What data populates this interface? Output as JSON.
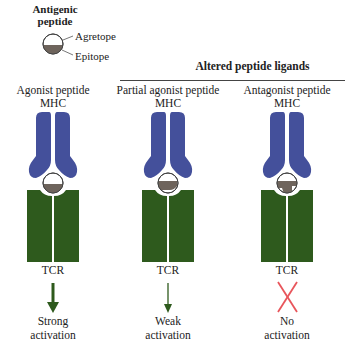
{
  "legend": {
    "title_line1": "Antigenic",
    "title_line2": "peptide",
    "agretope_label": "Agretope",
    "epitope_label": "Epitope"
  },
  "group_header": {
    "title": "Altered peptide ligands"
  },
  "columns": [
    {
      "title": "Agonist peptide",
      "mhc_label": "MHC",
      "tcr_label": "TCR",
      "outcome_icon": "arrow-down-strong",
      "outcome_line1": "Strong",
      "outcome_line2": "activation"
    },
    {
      "title": "Partial agonist peptide",
      "mhc_label": "MHC",
      "tcr_label": "TCR",
      "outcome_icon": "arrow-down-weak",
      "outcome_line1": "Weak",
      "outcome_line2": "activation"
    },
    {
      "title": "Antagonist peptide",
      "mhc_label": "MHC",
      "tcr_label": "TCR",
      "outcome_icon": "x-mark",
      "outcome_line1": "No",
      "outcome_line2": "activation"
    }
  ],
  "colors": {
    "mhc": "#44509b",
    "tcr": "#2e5a1d",
    "epitope": "#6e645c",
    "arrow": "#2e5a1d",
    "x_mark": "#e8555b"
  }
}
